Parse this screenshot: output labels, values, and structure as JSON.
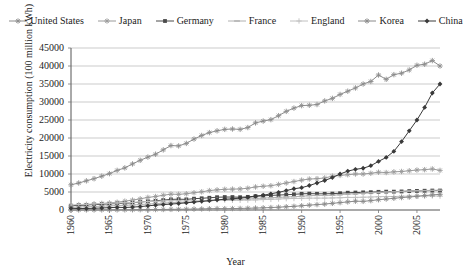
{
  "chart_data": {
    "type": "line",
    "title": "",
    "xlabel": "Year",
    "ylabel": "Electricity consumption (100 million kWh)",
    "xlim": [
      1960,
      2008
    ],
    "ylim": [
      0,
      45000
    ],
    "ytick_labels": [
      "45000",
      "40000",
      "35000",
      "30000",
      "25000",
      "20000",
      "15000",
      "10000",
      "5000",
      "0"
    ],
    "ytick_values": [
      45000,
      40000,
      35000,
      30000,
      25000,
      20000,
      15000,
      10000,
      5000,
      0
    ],
    "xtick_labels": [
      "1960",
      "1965",
      "1970",
      "1975",
      "1980",
      "1985",
      "1990",
      "1995",
      "2000",
      "2005"
    ],
    "xtick_values": [
      1960,
      1965,
      1970,
      1975,
      1980,
      1985,
      1990,
      1995,
      2000,
      2005
    ],
    "grid": "horizontal",
    "legend_position": "top",
    "x": [
      1960,
      1961,
      1962,
      1963,
      1964,
      1965,
      1966,
      1967,
      1968,
      1969,
      1970,
      1971,
      1972,
      1973,
      1974,
      1975,
      1976,
      1977,
      1978,
      1979,
      1980,
      1981,
      1982,
      1983,
      1984,
      1985,
      1986,
      1987,
      1988,
      1989,
      1990,
      1991,
      1992,
      1993,
      1994,
      1995,
      1996,
      1997,
      1998,
      1999,
      2000,
      2001,
      2002,
      2003,
      2004,
      2005,
      2006,
      2007,
      2008
    ],
    "series": [
      {
        "name": "United States",
        "marker": "star",
        "color": "#8c8c8c",
        "values": [
          7000,
          7500,
          8100,
          8700,
          9400,
          10100,
          11000,
          11700,
          12800,
          13800,
          14700,
          15500,
          16700,
          17900,
          17800,
          18500,
          19700,
          20700,
          21500,
          22000,
          22400,
          22500,
          22400,
          22900,
          24200,
          24700,
          25100,
          26200,
          27400,
          28300,
          29000,
          29100,
          29300,
          30300,
          31000,
          32100,
          33000,
          33900,
          35000,
          35700,
          37500,
          36300,
          37600,
          38000,
          38900,
          40200,
          40500,
          41500,
          40000
        ]
      },
      {
        "name": "Japan",
        "marker": "cross",
        "color": "#9a9a9a",
        "values": [
          1150,
          1300,
          1450,
          1600,
          1800,
          1950,
          2150,
          2450,
          2750,
          3100,
          3500,
          3750,
          4100,
          4400,
          4350,
          4500,
          4800,
          5050,
          5400,
          5600,
          5750,
          5800,
          5850,
          6050,
          6400,
          6600,
          6750,
          7100,
          7500,
          7900,
          8300,
          8600,
          8700,
          8900,
          9400,
          9600,
          9800,
          10000,
          10000,
          10200,
          10500,
          10400,
          10600,
          10700,
          10900,
          11100,
          11200,
          11400,
          11000
        ]
      },
      {
        "name": "Germany",
        "marker": "square",
        "color": "#4a4a4a",
        "values": [
          1200,
          1300,
          1400,
          1500,
          1600,
          1700,
          1800,
          1850,
          2000,
          2200,
          2400,
          2550,
          2750,
          2950,
          3000,
          2950,
          3150,
          3250,
          3400,
          3550,
          3600,
          3600,
          3550,
          3650,
          3850,
          3950,
          4050,
          4150,
          4250,
          4350,
          4500,
          4550,
          4500,
          4500,
          4550,
          4650,
          4800,
          4850,
          4900,
          4950,
          5050,
          5100,
          5100,
          5150,
          5250,
          5300,
          5350,
          5400,
          5400
        ]
      },
      {
        "name": "France",
        "marker": "dash",
        "color": "#b0b0b0",
        "values": [
          750,
          820,
          900,
          980,
          1060,
          1150,
          1240,
          1300,
          1400,
          1530,
          1650,
          1760,
          1900,
          2050,
          2100,
          2100,
          2300,
          2400,
          2550,
          2700,
          2800,
          2850,
          2900,
          3000,
          3200,
          3300,
          3400,
          3500,
          3600,
          3700,
          3800,
          4000,
          4050,
          4050,
          4100,
          4250,
          4450,
          4500,
          4650,
          4750,
          4900,
          5000,
          5050,
          5150,
          5250,
          5350,
          5400,
          5450,
          5500
        ]
      },
      {
        "name": "England",
        "marker": "plus",
        "color": "#c0c0c0",
        "values": [
          1400,
          1500,
          1600,
          1700,
          1800,
          1900,
          1950,
          2000,
          2100,
          2250,
          2350,
          2400,
          2500,
          2600,
          2550,
          2500,
          2550,
          2600,
          2700,
          2800,
          2750,
          2700,
          2700,
          2750,
          2800,
          2900,
          2950,
          3050,
          3150,
          3200,
          3250,
          3300,
          3300,
          3300,
          3350,
          3400,
          3500,
          3500,
          3550,
          3600,
          3700,
          3750,
          3750,
          3800,
          3850,
          3900,
          3900,
          3900,
          3850
        ]
      },
      {
        "name": "Korea",
        "marker": "star",
        "color": "#8a8a8a",
        "values": [
          15,
          18,
          22,
          26,
          30,
          36,
          45,
          55,
          70,
          90,
          110,
          130,
          150,
          180,
          200,
          220,
          260,
          300,
          350,
          400,
          370,
          400,
          430,
          480,
          540,
          600,
          680,
          780,
          900,
          1020,
          1180,
          1350,
          1500,
          1650,
          1850,
          2050,
          2250,
          2450,
          2400,
          2600,
          2850,
          3050,
          3250,
          3450,
          3600,
          3800,
          4000,
          4200,
          4350
        ]
      },
      {
        "name": "China",
        "marker": "diamond",
        "color": "#3a3a3a",
        "values": [
          470,
          400,
          420,
          480,
          560,
          650,
          750,
          700,
          800,
          950,
          1150,
          1350,
          1500,
          1650,
          1800,
          2000,
          2200,
          2400,
          2600,
          2800,
          3000,
          3100,
          3300,
          3500,
          3800,
          4100,
          4500,
          4900,
          5400,
          5900,
          6200,
          6800,
          7500,
          8200,
          9000,
          10000,
          10800,
          11300,
          11600,
          12300,
          13500,
          14600,
          16300,
          19000,
          22000,
          25000,
          28500,
          32500,
          35000
        ]
      }
    ]
  }
}
